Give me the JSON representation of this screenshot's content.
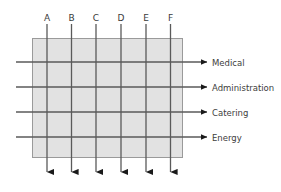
{
  "diagram": {
    "type": "matrix-flow-diagram",
    "box": {
      "fill_color": "#e2e2e2",
      "border_color": "#9a9a9a"
    },
    "line_color": "#5a5a5a",
    "arrow_color": "#1a1a1a",
    "columns": [
      {
        "label": "A",
        "x": 47
      },
      {
        "label": "B",
        "x": 71.5
      },
      {
        "label": "C",
        "x": 96
      },
      {
        "label": "D",
        "x": 121
      },
      {
        "label": "E",
        "x": 146
      },
      {
        "label": "F",
        "x": 170.5
      }
    ],
    "rows": [
      {
        "label": "Medical",
        "y": 62
      },
      {
        "label": "Administration",
        "y": 87
      },
      {
        "label": "Catering",
        "y": 112
      },
      {
        "label": "Energy",
        "y": 137
      }
    ]
  }
}
